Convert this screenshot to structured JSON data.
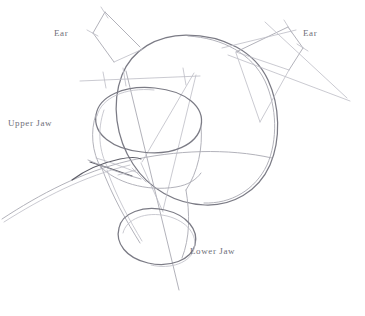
{
  "document": {
    "kind": "pencil-sketch",
    "subject": "animal head construction drawing",
    "background_color": "#ffffff",
    "pencil_color": "#8a8a92",
    "pencil_dark_color": "#5c5c66",
    "width": 365,
    "height": 316
  },
  "labels": {
    "ear_left": "Ear",
    "ear_right": "Ear",
    "upper_jaw": "Upper Jaw",
    "lower_jaw": "Lower Jaw"
  },
  "shapes": {
    "cranium_sphere": "large circle forming the skull mass",
    "muzzle_cylinder": "tilted cylinder forming the snout",
    "upper_jaw_ellipse": "top ellipse of the muzzle cylinder",
    "lower_jaw_ellipse": "bottom ellipse of the muzzle cylinder",
    "ear_left_quad": "left ear quadrilateral",
    "ear_right_quad": "right ear quadrilateral",
    "horizontal_axis": "horizontal construction line with tick marks",
    "vertical_axis": "vertical centre construction line",
    "neck_curve": "long sweeping neck curve",
    "nose_detail": "dark nose / lip stroke"
  }
}
